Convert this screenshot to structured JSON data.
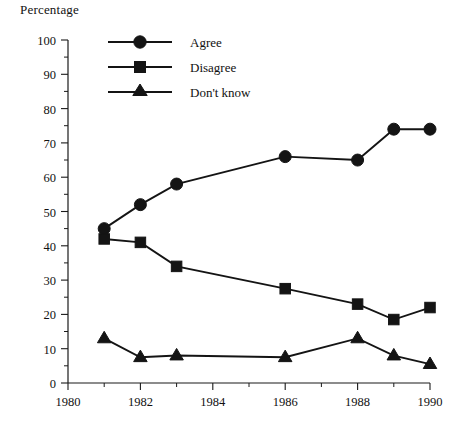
{
  "chart_data": {
    "type": "line",
    "title": "",
    "xlabel": "",
    "ylabel": "Percentage",
    "xlim": [
      1980,
      1990
    ],
    "ylim": [
      0,
      100
    ],
    "grid": false,
    "legend_position": "top-left-inside",
    "x": [
      1981,
      1982,
      1983,
      1986,
      1988,
      1989,
      1990
    ],
    "xticks": [
      1980,
      1982,
      1984,
      1986,
      1988,
      1990
    ],
    "xtick_labels": [
      "1980",
      "1982",
      "1984",
      "1986",
      "1988",
      "1990"
    ],
    "xminorticks": [
      1981,
      1983,
      1985,
      1987,
      1989
    ],
    "yticks": [
      0,
      10,
      20,
      30,
      40,
      50,
      60,
      70,
      80,
      90,
      100
    ],
    "ytick_labels": [
      "0",
      "10",
      "20",
      "30",
      "40",
      "50",
      "60",
      "70",
      "80",
      "90",
      "100"
    ],
    "yminorticks": [
      5,
      15,
      25,
      35,
      45,
      55,
      65,
      75,
      85,
      95
    ],
    "series": [
      {
        "name": "Agree",
        "marker": "circle",
        "color": "#141414",
        "values": [
          45,
          52,
          58,
          66,
          65,
          74,
          74
        ]
      },
      {
        "name": "Disagree",
        "marker": "square",
        "color": "#141414",
        "values": [
          42,
          41,
          34,
          27.5,
          23,
          18.5,
          22
        ]
      },
      {
        "name": "Don't know",
        "marker": "triangle",
        "color": "#141414",
        "values": [
          13,
          7.5,
          8,
          7.5,
          13,
          8,
          5.5
        ]
      }
    ]
  },
  "axis": {
    "y_title": "Percentage"
  },
  "legend": {
    "items": [
      {
        "label": "Agree",
        "marker": "circle-marker"
      },
      {
        "label": "Disagree",
        "marker": "square-marker"
      },
      {
        "label": "Don't know",
        "marker": "triangle-marker"
      }
    ]
  },
  "ytick_labels": {
    "t0": "0",
    "t10": "10",
    "t20": "20",
    "t30": "30",
    "t40": "40",
    "t50": "50",
    "t60": "60",
    "t70": "70",
    "t80": "80",
    "t90": "90",
    "t100": "100"
  },
  "xtick_labels": {
    "t1980": "1980",
    "t1982": "1982",
    "t1984": "1984",
    "t1986": "1986",
    "t1988": "1988",
    "t1990": "1990"
  },
  "colors": {
    "ink": "#141414",
    "background": "#ffffff"
  }
}
